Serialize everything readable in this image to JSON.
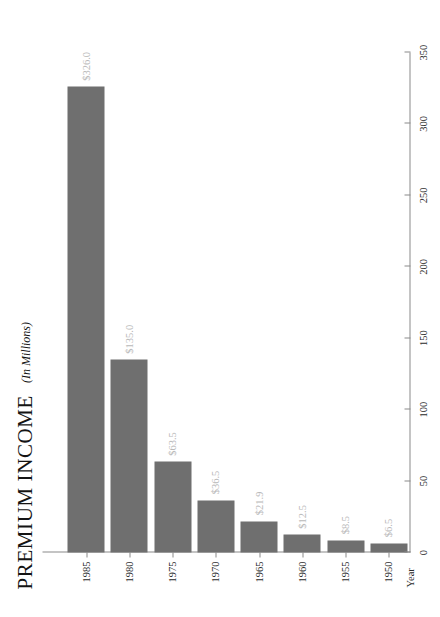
{
  "chart_data": {
    "type": "bar",
    "orientation": "horizontal",
    "title": "PREMIUM INCOME",
    "subtitle": "(In Millions)",
    "xlabel": "",
    "ylabel": "Year",
    "categories": [
      "1950",
      "1955",
      "1960",
      "1965",
      "1970",
      "1975",
      "1980",
      "1985"
    ],
    "values": [
      6.5,
      8.5,
      12.5,
      21.9,
      36.5,
      63.5,
      135.0,
      326.0
    ],
    "data_labels": [
      "$6.5",
      "$8.5",
      "$12.5",
      "$21.9",
      "$36.5",
      "$63.5",
      "$135.0",
      "$326.0"
    ],
    "value_ticks": [
      0,
      50,
      100,
      150,
      200,
      250,
      300,
      350
    ],
    "value_tick_labels": [
      "0",
      "50",
      "100",
      "150",
      "200",
      "250",
      "300",
      "350"
    ],
    "xlim": [
      0,
      350
    ],
    "grid": false,
    "legend": false,
    "bar_color": "#6f6f6f",
    "data_label_color": "#b9b9b9",
    "axis_color": "#8a8a8a",
    "text_color": "#1a1a1a",
    "background": "#ffffff"
  }
}
